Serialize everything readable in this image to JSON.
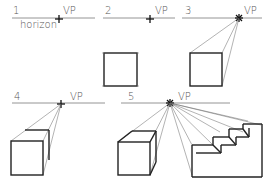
{
  "panels": [
    {
      "number": "1",
      "vp_label": "VP",
      "horizon_label": "horizon"
    },
    {
      "number": "2",
      "vp_label": "VP"
    },
    {
      "number": "3",
      "vp_label": "VP"
    },
    {
      "number": "4",
      "vp_label": "VP"
    },
    {
      "number": "5",
      "vp_label": "VP"
    }
  ],
  "colors": {
    "ink": "#222222",
    "guide": "#666666",
    "horizon": "#888888",
    "background": "#ffffff"
  }
}
